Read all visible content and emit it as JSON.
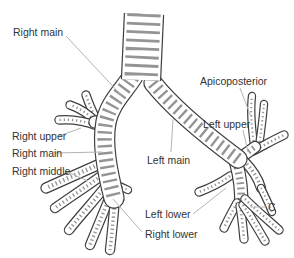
{
  "diagram": {
    "labels": {
      "right_main_top": "Right main",
      "right_upper": "Right upper",
      "right_main": "Right main",
      "right_middle": "Right middle",
      "right_lower": "Right lower",
      "left_main": "Left main",
      "left_upper": "Left upper",
      "left_lower": "Left lower",
      "apicoposterior": "Apicoposterior",
      "c": "C"
    },
    "colors": {
      "background": "#ffffff",
      "ink": "#3f3f3f",
      "rib_shading": "#949494",
      "tube_fill": "#ffffff",
      "leader_line": "#b4b4b4",
      "label_text": "#333333"
    }
  }
}
